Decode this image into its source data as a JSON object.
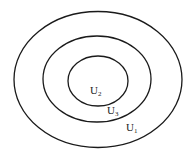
{
  "diagram": {
    "type": "nested-ellipses",
    "stroke_color": "#1a1a1a",
    "background": "#ffffff",
    "regions": [
      {
        "id": "outer",
        "label_base": "U",
        "label_sub": "1",
        "cx": 98,
        "cy": 79.5,
        "rx": 84,
        "ry": 68,
        "label_x": 126,
        "label_y": 131
      },
      {
        "id": "middle",
        "label_base": "U",
        "label_sub": "3",
        "cx": 97,
        "cy": 79,
        "rx": 54,
        "ry": 43,
        "label_x": 107,
        "label_y": 114
      },
      {
        "id": "inner",
        "label_base": "U",
        "label_sub": "2",
        "cx": 98,
        "cy": 81,
        "rx": 30,
        "ry": 25,
        "label_x": 90,
        "label_y": 94
      }
    ]
  }
}
